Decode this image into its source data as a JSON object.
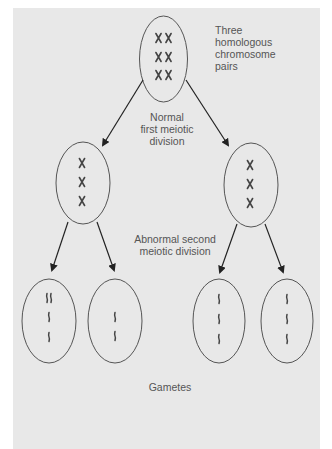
{
  "figure": {
    "background_color": "#e8e8e8",
    "line_color": "#555555",
    "chromosome_color": "#444444",
    "labels": {
      "parent_cell": "Three\nhomologous\nchromosome\npairs",
      "first_division": "Normal\nfirst meiotic\ndivision",
      "second_division": "Abnormal second\nmeiotic division",
      "gametes": "Gametes"
    },
    "cells": [
      {
        "id": "parent",
        "stage": "parent",
        "chromosomes": "3 homologous pairs (6 X-shaped)"
      },
      {
        "id": "mid-left",
        "stage": "after first division",
        "chromosomes": "3 X-shaped"
      },
      {
        "id": "mid-right",
        "stage": "after first division",
        "chromosomes": "3 X-shaped"
      },
      {
        "id": "gamete-1",
        "stage": "gamete",
        "chromosomes": "4 chromatids (one extra pair)"
      },
      {
        "id": "gamete-2",
        "stage": "gamete",
        "chromosomes": "2 chromatids (one missing)"
      },
      {
        "id": "gamete-3",
        "stage": "gamete",
        "chromosomes": "3 chromatids (normal)"
      },
      {
        "id": "gamete-4",
        "stage": "gamete",
        "chromosomes": "3 chromatids (normal)"
      }
    ],
    "arrows": [
      {
        "from": "parent",
        "to": "mid-left"
      },
      {
        "from": "parent",
        "to": "mid-right"
      },
      {
        "from": "mid-left",
        "to": "gamete-1"
      },
      {
        "from": "mid-left",
        "to": "gamete-2"
      },
      {
        "from": "mid-right",
        "to": "gamete-3"
      },
      {
        "from": "mid-right",
        "to": "gamete-4"
      }
    ]
  }
}
